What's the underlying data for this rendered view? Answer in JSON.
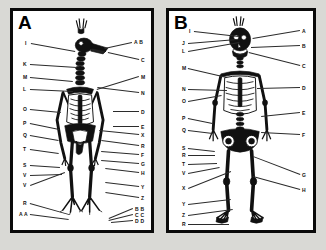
{
  "figure": {
    "background_color": "#d9d9d5",
    "frame_color": "#0a0a0a",
    "panel_background": "#ffffff",
    "line_color": "#2b2b2b"
  },
  "panels": [
    {
      "id": "panel-a",
      "letter": "A",
      "subject": "bird-skeleton",
      "left_labels": [
        {
          "text": "I",
          "x": 12,
          "y": 30,
          "lx": 18,
          "ly": 32,
          "tx": 62,
          "ty": 40
        },
        {
          "text": "K",
          "x": 10,
          "y": 51,
          "lx": 17,
          "ly": 53,
          "tx": 64,
          "ty": 56
        },
        {
          "text": "M",
          "x": 10,
          "y": 64,
          "lx": 17,
          "ly": 66,
          "tx": 60,
          "ty": 70
        },
        {
          "text": "L",
          "x": 10,
          "y": 76,
          "lx": 17,
          "ly": 78,
          "tx": 60,
          "ty": 80
        },
        {
          "text": "O",
          "x": 10,
          "y": 96,
          "lx": 17,
          "ly": 98,
          "tx": 48,
          "ty": 101
        },
        {
          "text": "P",
          "x": 10,
          "y": 110,
          "lx": 17,
          "ly": 112,
          "tx": 46,
          "ty": 118
        },
        {
          "text": "Q",
          "x": 10,
          "y": 122,
          "lx": 17,
          "ly": 124,
          "tx": 46,
          "ty": 129
        },
        {
          "text": "T",
          "x": 10,
          "y": 136,
          "lx": 17,
          "ly": 138,
          "tx": 46,
          "ty": 142
        },
        {
          "text": "S",
          "x": 10,
          "y": 152,
          "lx": 17,
          "ly": 154,
          "tx": 47,
          "ty": 156
        },
        {
          "text": "V",
          "x": 10,
          "y": 162,
          "lx": 17,
          "ly": 164,
          "tx": 49,
          "ty": 163
        },
        {
          "text": "V",
          "x": 10,
          "y": 172,
          "lx": 17,
          "ly": 174,
          "tx": 52,
          "ty": 161
        },
        {
          "text": "R",
          "x": 10,
          "y": 190,
          "lx": 17,
          "ly": 192,
          "tx": 56,
          "ty": 203
        },
        {
          "text": "A A",
          "x": 6,
          "y": 201,
          "lx": 17,
          "ly": 203,
          "tx": 56,
          "ty": 208
        }
      ],
      "right_labels": [
        {
          "text": "A B",
          "x": 121,
          "y": 29,
          "lx": 119,
          "ly": 32,
          "tx": 92,
          "ty": 38
        },
        {
          "text": "C",
          "x": 128,
          "y": 47,
          "lx": 126,
          "ly": 49,
          "tx": 95,
          "ty": 42
        },
        {
          "text": "M",
          "x": 128,
          "y": 64,
          "lx": 126,
          "ly": 66,
          "tx": 84,
          "ty": 79
        },
        {
          "text": "N",
          "x": 128,
          "y": 80,
          "lx": 126,
          "ly": 82,
          "tx": 84,
          "ty": 77
        },
        {
          "text": "D",
          "x": 128,
          "y": 99,
          "lx": 126,
          "ly": 101,
          "tx": 100,
          "ty": 101
        },
        {
          "text": "E",
          "x": 128,
          "y": 114,
          "lx": 126,
          "ly": 116,
          "tx": 100,
          "ty": 116
        },
        {
          "text": "X",
          "x": 128,
          "y": 122,
          "lx": 126,
          "ly": 124,
          "tx": 86,
          "ty": 120
        },
        {
          "text": "R",
          "x": 128,
          "y": 133,
          "lx": 126,
          "ly": 135,
          "tx": 88,
          "ty": 130
        },
        {
          "text": "F",
          "x": 128,
          "y": 142,
          "lx": 126,
          "ly": 144,
          "tx": 88,
          "ty": 141
        },
        {
          "text": "G",
          "x": 128,
          "y": 151,
          "lx": 126,
          "ly": 153,
          "tx": 88,
          "ty": 150
        },
        {
          "text": "H",
          "x": 128,
          "y": 160,
          "lx": 126,
          "ly": 162,
          "tx": 92,
          "ty": 158
        },
        {
          "text": "Y",
          "x": 128,
          "y": 174,
          "lx": 126,
          "ly": 176,
          "tx": 92,
          "ty": 172
        },
        {
          "text": "Z",
          "x": 128,
          "y": 185,
          "lx": 126,
          "ly": 187,
          "tx": 92,
          "ty": 182
        },
        {
          "text": "B B",
          "x": 122,
          "y": 196,
          "lx": 120,
          "ly": 198,
          "tx": 96,
          "ty": 208
        },
        {
          "text": "C C",
          "x": 122,
          "y": 202,
          "lx": 120,
          "ly": 204,
          "tx": 96,
          "ty": 210
        },
        {
          "text": "D D",
          "x": 122,
          "y": 208,
          "lx": 120,
          "ly": 210,
          "tx": 98,
          "ty": 212
        }
      ]
    },
    {
      "id": "panel-b",
      "letter": "B",
      "subject": "human-skeleton",
      "left_labels": [
        {
          "text": "I",
          "x": 20,
          "y": 18,
          "lx": 25,
          "ly": 20,
          "tx": 70,
          "ty": 25
        },
        {
          "text": "J",
          "x": 13,
          "y": 30,
          "lx": 19,
          "ly": 32,
          "tx": 68,
          "ty": 28
        },
        {
          "text": "L",
          "x": 13,
          "y": 38,
          "lx": 19,
          "ly": 40,
          "tx": 70,
          "ty": 31
        },
        {
          "text": "M",
          "x": 13,
          "y": 55,
          "lx": 19,
          "ly": 57,
          "tx": 58,
          "ty": 66
        },
        {
          "text": "N",
          "x": 13,
          "y": 76,
          "lx": 19,
          "ly": 78,
          "tx": 58,
          "ty": 79
        },
        {
          "text": "O",
          "x": 13,
          "y": 88,
          "lx": 19,
          "ly": 90,
          "tx": 52,
          "ty": 84
        },
        {
          "text": "P",
          "x": 13,
          "y": 105,
          "lx": 19,
          "ly": 107,
          "tx": 44,
          "ty": 112
        },
        {
          "text": "Q",
          "x": 13,
          "y": 117,
          "lx": 19,
          "ly": 119,
          "tx": 44,
          "ty": 122
        },
        {
          "text": "S",
          "x": 13,
          "y": 135,
          "lx": 19,
          "ly": 137,
          "tx": 46,
          "ty": 140
        },
        {
          "text": "R",
          "x": 13,
          "y": 142,
          "lx": 19,
          "ly": 144,
          "tx": 46,
          "ty": 144
        },
        {
          "text": "T",
          "x": 13,
          "y": 151,
          "lx": 19,
          "ly": 153,
          "tx": 48,
          "ty": 152
        },
        {
          "text": "V",
          "x": 13,
          "y": 160,
          "lx": 19,
          "ly": 162,
          "tx": 50,
          "ty": 156
        },
        {
          "text": "X",
          "x": 13,
          "y": 175,
          "lx": 19,
          "ly": 177,
          "tx": 62,
          "ty": 160
        },
        {
          "text": "Y",
          "x": 13,
          "y": 191,
          "lx": 19,
          "ly": 193,
          "tx": 62,
          "ty": 188
        },
        {
          "text": "Z",
          "x": 13,
          "y": 202,
          "lx": 19,
          "ly": 204,
          "tx": 64,
          "ty": 198
        },
        {
          "text": "R",
          "x": 13,
          "y": 211,
          "lx": 19,
          "ly": 213,
          "tx": 60,
          "ty": 213
        }
      ],
      "right_labels": [
        {
          "text": "A",
          "x": 133,
          "y": 18,
          "lx": 131,
          "ly": 20,
          "tx": 84,
          "ty": 28
        },
        {
          "text": "B",
          "x": 133,
          "y": 33,
          "lx": 131,
          "ly": 35,
          "tx": 82,
          "ty": 37
        },
        {
          "text": "C",
          "x": 133,
          "y": 53,
          "lx": 131,
          "ly": 55,
          "tx": 80,
          "ty": 42
        },
        {
          "text": "D",
          "x": 133,
          "y": 75,
          "lx": 131,
          "ly": 77,
          "tx": 88,
          "ty": 78
        },
        {
          "text": "E",
          "x": 133,
          "y": 100,
          "lx": 131,
          "ly": 102,
          "tx": 92,
          "ty": 106
        },
        {
          "text": "F",
          "x": 133,
          "y": 122,
          "lx": 131,
          "ly": 124,
          "tx": 92,
          "ty": 122
        },
        {
          "text": "G",
          "x": 133,
          "y": 162,
          "lx": 131,
          "ly": 164,
          "tx": 84,
          "ty": 146
        },
        {
          "text": "H",
          "x": 133,
          "y": 177,
          "lx": 131,
          "ly": 179,
          "tx": 84,
          "ty": 166
        }
      ]
    }
  ]
}
